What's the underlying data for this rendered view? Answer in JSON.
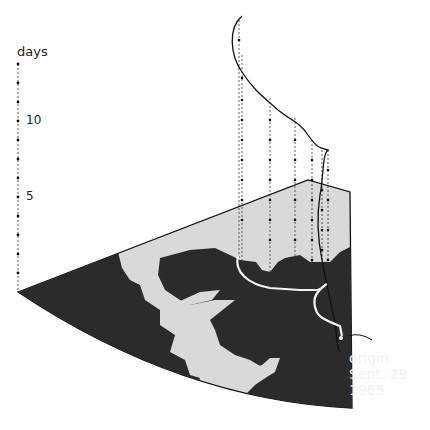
{
  "figure": {
    "type": "3D storm track diagram over map (time axis vertical)",
    "axis": {
      "title": "days",
      "ticks": [
        {
          "label": "10",
          "value": 10
        },
        {
          "label": "5",
          "value": 5
        }
      ],
      "tick_count_dots": 13
    },
    "annotation": {
      "line1": "origin",
      "line2": "Sept. 29",
      "line3": "1965"
    },
    "colors": {
      "land": "#2b2b2b",
      "water": "#d9d9d9",
      "track_ground": "#f2f2f2",
      "track_air": "#111111",
      "background": "#ffffff"
    }
  }
}
